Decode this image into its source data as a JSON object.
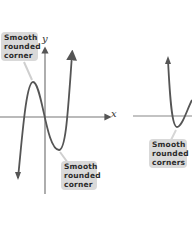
{
  "diagram": {
    "left_graph": {
      "axis_x_label": "x",
      "axis_y_label": "y",
      "callout_top": [
        "Smooth",
        "rounded",
        "corner"
      ],
      "callout_bottom": [
        "Smooth",
        "rounded",
        "corner"
      ]
    },
    "right_graph": {
      "callout_bottom": [
        "Smooth",
        "rounded",
        "corners"
      ]
    },
    "colors": {
      "curve": "#555555",
      "axis": "#666666",
      "callout_bg": "#d9d9d9",
      "callout_text": "#2b2b2b"
    }
  }
}
